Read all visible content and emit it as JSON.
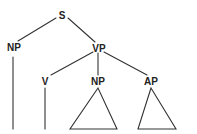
{
  "diagram": {
    "type": "syntax-tree",
    "colors": {
      "line": "#333333",
      "text": "#222222",
      "background": "#ffffff"
    },
    "nodes": {
      "root": {
        "label": "S"
      },
      "subject": {
        "label": "NP"
      },
      "predicate": {
        "label": "VP"
      },
      "verb": {
        "label": "V"
      },
      "object": {
        "label": "NP"
      },
      "complement": {
        "label": "AP"
      }
    },
    "edges": [
      [
        "S",
        "NP"
      ],
      [
        "S",
        "VP"
      ],
      [
        "VP",
        "V"
      ],
      [
        "VP",
        "NP"
      ],
      [
        "VP",
        "AP"
      ]
    ],
    "leaves": {
      "NP_subject": "line",
      "V": "line",
      "NP_object": "triangle",
      "AP": "triangle"
    }
  }
}
